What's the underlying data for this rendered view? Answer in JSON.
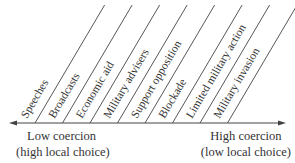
{
  "diagram": {
    "type": "coercion-spectrum",
    "categories": [
      "Speeches",
      "Broadcasts",
      "Economic aid",
      "Military advisers",
      "Support opposition",
      "Blockade",
      "Limited military action",
      "Military invasion"
    ],
    "axis": {
      "left_label": "Low coercion",
      "left_sublabel": "(high local choice)",
      "right_label": "High coercion",
      "right_sublabel": "(low local choice)"
    },
    "colors": {
      "line": "#444444",
      "text": "#333333"
    }
  }
}
